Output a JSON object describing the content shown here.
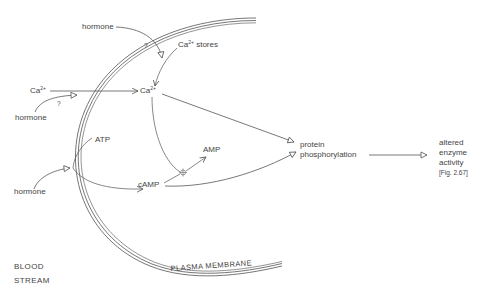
{
  "diagram": {
    "labels": {
      "hormone_top": "hormone",
      "ca_stores_base": "Ca",
      "ca_stores_sup": "2+",
      "ca_stores_rest": " stores",
      "q_top": "?",
      "ca_ext_base": "Ca",
      "ca_ext_sup": "2+",
      "q_left": "?",
      "hormone_left": "hormone",
      "ca_int_base": "Ca",
      "ca_int_sup": "2+",
      "atp": "ATP",
      "amp": "AMP",
      "camp": "cAMP",
      "hormone_bottom": "hormone",
      "protein": "protein",
      "phosphorylation": "phosphorylation",
      "altered": "altered",
      "enzyme": "enzyme",
      "activity": "activity",
      "fig_ref": "[Fig. 2.67]",
      "blood": "BLOOD",
      "stream": "STREAM",
      "membrane": "PLASMA MEMBRANE"
    },
    "colors": {
      "line": "#555555",
      "text": "#444444"
    }
  }
}
